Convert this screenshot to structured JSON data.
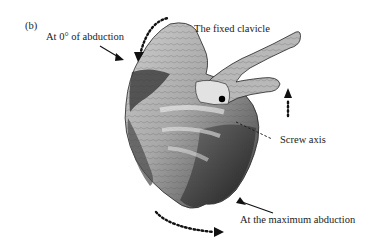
{
  "figure": {
    "panel_label": "(b)",
    "labels": {
      "zero_abduction": "At 0° of abduction",
      "fixed_clavicle": "The fixed clavicle",
      "screw_axis": "Screw axis",
      "max_abduction": "At the maximum abduction"
    },
    "colors": {
      "background": "#ffffff",
      "text": "#1a1a1a",
      "bone_light": "#d9d9d9",
      "bone_mid": "#8a8a8a",
      "bone_dark": "#2b2b2b"
    }
  }
}
